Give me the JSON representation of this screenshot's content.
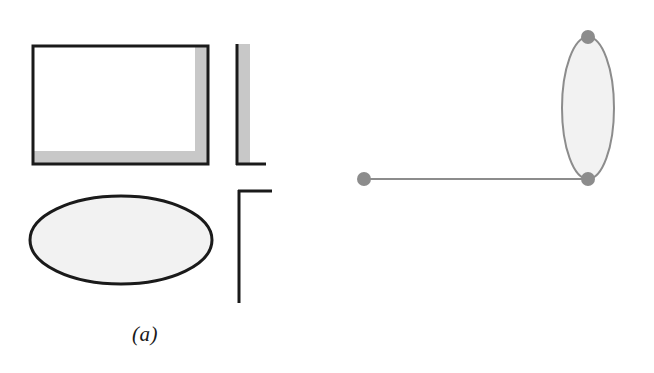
{
  "figure": {
    "background_color": "#ffffff",
    "width": 654,
    "height": 373,
    "panels": [
      {
        "id": "a",
        "caption": "(a)",
        "elements": [
          {
            "name": "shadowed-rectangle",
            "type": "rectangle",
            "x": 33,
            "y": 46,
            "width": 175,
            "height": 118,
            "stroke_color": "#1a1a1a",
            "stroke_width": 3,
            "fill_color": "#ffffff",
            "inner_shadow_color": "#c8c8c8",
            "inner_shadow_band": 13
          },
          {
            "name": "vertical-shadow-bar",
            "type": "bar",
            "x": 236,
            "y": 44,
            "width": 14,
            "height": 120,
            "line_color": "#1a1a1a",
            "fill_color": "#c8c8c8",
            "foot_length": 28
          },
          {
            "name": "ellipse-outline",
            "type": "ellipse",
            "cx": 121,
            "cy": 240,
            "rx": 91,
            "ry": 44,
            "stroke_color": "#1a1a1a",
            "stroke_width": 3,
            "fill_color": "#f2f2f2"
          },
          {
            "name": "corner-bracket",
            "type": "bracket",
            "x": 238,
            "y": 190,
            "arm_length": 34,
            "stem_length": 113,
            "stroke_color": "#1a1a1a",
            "stroke_width": 3
          }
        ]
      },
      {
        "id": "b",
        "caption": "(b)",
        "graph": {
          "node_color": "#8c8c8c",
          "node_radius": 7,
          "edge_color": "#8c8c8c",
          "edge_width": 2,
          "loop_fill_color": "#f2f2f2",
          "nodes": [
            {
              "name": "node-left",
              "cx": 364,
              "cy": 179
            },
            {
              "name": "node-bottom",
              "cx": 588,
              "cy": 179
            },
            {
              "name": "node-top",
              "cx": 588,
              "cy": 37
            }
          ],
          "edges": [
            {
              "name": "edge-left-to-bottom",
              "from": "node-left",
              "to": "node-bottom"
            }
          ],
          "loops": [
            {
              "name": "lens-loop",
              "between": [
                "node-bottom",
                "node-top"
              ],
              "cx": 588,
              "cy": 108,
              "rx": 26,
              "ry": 71
            }
          ]
        }
      }
    ]
  }
}
